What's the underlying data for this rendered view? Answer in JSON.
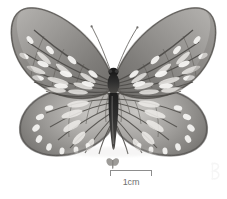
{
  "image": {
    "subject": "butterfly-specimen",
    "view": "dorsal-spread-mounted",
    "background_color": "#ffffff",
    "specimen": {
      "body_color": "#2b2b2b",
      "wing_vein_color": "#5c5a57",
      "wing_ground_color": "#8f8d8a",
      "wing_spot_color": "#f2f1ee",
      "antenna_color": "#6b6b6b",
      "parts": [
        "left-forewing",
        "right-forewing",
        "left-hindwing",
        "right-hindwing",
        "thorax",
        "abdomen",
        "left-antenna",
        "right-antenna"
      ]
    }
  },
  "scale": {
    "label": "1cm",
    "bar_color": "#8d8d8d",
    "label_color": "#6f6f6f"
  },
  "icons": {
    "mini_butterfly": "butterfly-icon",
    "watermark": "watermark-glyph"
  }
}
